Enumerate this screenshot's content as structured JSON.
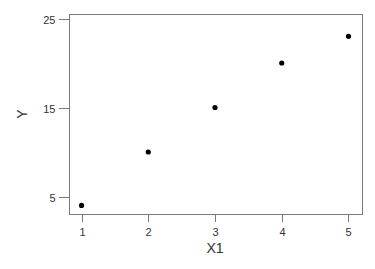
{
  "chart_data": {
    "type": "scatter",
    "title": "",
    "xlabel": "X1",
    "ylabel": "Y",
    "x": [
      1,
      2,
      3,
      4,
      5
    ],
    "series": [
      {
        "name": "Y",
        "values": [
          4,
          10,
          15,
          20,
          23
        ]
      }
    ],
    "xticks": [
      1,
      2,
      3,
      4,
      5
    ],
    "xtick_labels": [
      "1",
      "2",
      "3",
      "4",
      "5"
    ],
    "yticks": [
      5,
      15,
      25
    ],
    "ytick_labels": [
      "5",
      "15",
      "25"
    ],
    "xlim": [
      0.82,
      5.21
    ],
    "ylim": [
      2.98,
      25.45
    ],
    "grid": false,
    "legend": "none",
    "colors": {
      "points": "#000000",
      "axis": "#7a7a7a",
      "text": "#333333"
    }
  }
}
